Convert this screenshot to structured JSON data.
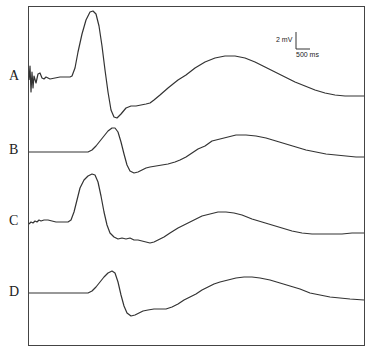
{
  "chart_data": {
    "type": "line",
    "title": "",
    "xlabel": "",
    "ylabel": "",
    "grid": false,
    "legend": "none",
    "frame": {
      "left": 28,
      "top": 6,
      "right": 364,
      "bottom": 345
    },
    "scale_bar": {
      "voltage_label": "2 mV",
      "time_label": "500 ms",
      "x": 296,
      "y_top": 32,
      "y_bottom": 49,
      "x_right": 310
    },
    "series": [
      {
        "name": "A",
        "label_pos": {
          "x": 9,
          "y": 76
        },
        "baseline_y": 78,
        "points": [
          [
            29,
            80
          ],
          [
            30,
            66
          ],
          [
            31,
            92
          ],
          [
            32,
            72
          ],
          [
            33,
            88
          ],
          [
            34,
            76
          ],
          [
            36,
            83
          ],
          [
            38,
            74
          ],
          [
            40,
            73
          ],
          [
            42,
            78
          ],
          [
            44,
            79
          ],
          [
            46,
            77
          ],
          [
            50,
            79
          ],
          [
            55,
            78
          ],
          [
            60,
            77
          ],
          [
            66,
            77
          ],
          [
            70,
            77
          ],
          [
            72,
            76
          ],
          [
            75,
            68
          ],
          [
            78,
            52
          ],
          [
            82,
            34
          ],
          [
            86,
            20
          ],
          [
            90,
            12
          ],
          [
            93,
            11
          ],
          [
            96,
            14
          ],
          [
            99,
            26
          ],
          [
            102,
            46
          ],
          [
            105,
            70
          ],
          [
            108,
            92
          ],
          [
            111,
            110
          ],
          [
            114,
            117
          ],
          [
            117,
            118
          ],
          [
            121,
            114
          ],
          [
            126,
            108
          ],
          [
            131,
            106
          ],
          [
            136,
            106
          ],
          [
            141,
            105
          ],
          [
            146,
            104
          ],
          [
            150,
            103
          ],
          [
            154,
            100
          ],
          [
            160,
            95
          ],
          [
            168,
            88
          ],
          [
            178,
            80
          ],
          [
            186,
            75
          ],
          [
            195,
            68
          ],
          [
            205,
            62
          ],
          [
            215,
            58
          ],
          [
            225,
            56
          ],
          [
            235,
            56
          ],
          [
            245,
            58
          ],
          [
            255,
            62
          ],
          [
            265,
            67
          ],
          [
            275,
            72
          ],
          [
            285,
            77
          ],
          [
            295,
            82
          ],
          [
            305,
            86
          ],
          [
            315,
            90
          ],
          [
            325,
            93
          ],
          [
            335,
            95
          ],
          [
            345,
            96
          ],
          [
            355,
            96
          ],
          [
            364,
            96
          ]
        ]
      },
      {
        "name": "B",
        "label_pos": {
          "x": 9,
          "y": 150
        },
        "baseline_y": 152,
        "points": [
          [
            29,
            152
          ],
          [
            40,
            152
          ],
          [
            50,
            152
          ],
          [
            60,
            152
          ],
          [
            70,
            152
          ],
          [
            80,
            152
          ],
          [
            88,
            152
          ],
          [
            92,
            150
          ],
          [
            96,
            146
          ],
          [
            100,
            141
          ],
          [
            104,
            136
          ],
          [
            108,
            131
          ],
          [
            112,
            128
          ],
          [
            115,
            128
          ],
          [
            118,
            132
          ],
          [
            121,
            142
          ],
          [
            124,
            154
          ],
          [
            127,
            165
          ],
          [
            130,
            171
          ],
          [
            134,
            173
          ],
          [
            138,
            172
          ],
          [
            142,
            170
          ],
          [
            146,
            168
          ],
          [
            150,
            167
          ],
          [
            156,
            166
          ],
          [
            162,
            165
          ],
          [
            168,
            164
          ],
          [
            175,
            162
          ],
          [
            180,
            160
          ],
          [
            186,
            157
          ],
          [
            192,
            153
          ],
          [
            198,
            149
          ],
          [
            205,
            146
          ],
          [
            212,
            141
          ],
          [
            220,
            139
          ],
          [
            228,
            137
          ],
          [
            236,
            135
          ],
          [
            246,
            135
          ],
          [
            256,
            136
          ],
          [
            266,
            138
          ],
          [
            276,
            141
          ],
          [
            286,
            144
          ],
          [
            296,
            147
          ],
          [
            306,
            150
          ],
          [
            316,
            152
          ],
          [
            326,
            154
          ],
          [
            336,
            155
          ],
          [
            346,
            156
          ],
          [
            356,
            157
          ],
          [
            364,
            157
          ]
        ]
      },
      {
        "name": "C",
        "label_pos": {
          "x": 9,
          "y": 221
        },
        "baseline_y": 222,
        "points": [
          [
            29,
            224
          ],
          [
            31,
            222
          ],
          [
            33,
            223
          ],
          [
            35,
            221
          ],
          [
            37,
            222
          ],
          [
            39,
            220
          ],
          [
            41,
            221
          ],
          [
            44,
            220
          ],
          [
            48,
            220
          ],
          [
            52,
            221
          ],
          [
            56,
            222
          ],
          [
            60,
            222
          ],
          [
            64,
            222
          ],
          [
            68,
            222
          ],
          [
            71,
            220
          ],
          [
            74,
            212
          ],
          [
            77,
            200
          ],
          [
            80,
            188
          ],
          [
            84,
            180
          ],
          [
            88,
            176
          ],
          [
            92,
            174
          ],
          [
            95,
            175
          ],
          [
            98,
            182
          ],
          [
            101,
            196
          ],
          [
            104,
            212
          ],
          [
            107,
            225
          ],
          [
            110,
            233
          ],
          [
            114,
            237
          ],
          [
            118,
            239
          ],
          [
            122,
            238
          ],
          [
            126,
            239
          ],
          [
            130,
            238
          ],
          [
            134,
            240
          ],
          [
            138,
            240
          ],
          [
            142,
            241
          ],
          [
            146,
            242
          ],
          [
            150,
            243
          ],
          [
            154,
            242
          ],
          [
            158,
            240
          ],
          [
            164,
            237
          ],
          [
            170,
            233
          ],
          [
            178,
            228
          ],
          [
            186,
            224
          ],
          [
            194,
            220
          ],
          [
            202,
            216
          ],
          [
            210,
            214
          ],
          [
            218,
            212
          ],
          [
            226,
            212
          ],
          [
            234,
            213
          ],
          [
            242,
            215
          ],
          [
            252,
            219
          ],
          [
            262,
            222
          ],
          [
            272,
            225
          ],
          [
            282,
            228
          ],
          [
            292,
            231
          ],
          [
            302,
            233
          ],
          [
            312,
            234
          ],
          [
            322,
            234
          ],
          [
            332,
            234
          ],
          [
            342,
            234
          ],
          [
            352,
            233
          ],
          [
            364,
            233
          ]
        ]
      },
      {
        "name": "D",
        "label_pos": {
          "x": 9,
          "y": 292
        },
        "baseline_y": 293,
        "points": [
          [
            29,
            293
          ],
          [
            40,
            293
          ],
          [
            50,
            293
          ],
          [
            60,
            293
          ],
          [
            70,
            293
          ],
          [
            80,
            293
          ],
          [
            88,
            293
          ],
          [
            92,
            291
          ],
          [
            96,
            287
          ],
          [
            100,
            282
          ],
          [
            104,
            277
          ],
          [
            108,
            273
          ],
          [
            112,
            271
          ],
          [
            115,
            273
          ],
          [
            118,
            282
          ],
          [
            121,
            295
          ],
          [
            124,
            306
          ],
          [
            127,
            313
          ],
          [
            131,
            316
          ],
          [
            135,
            315
          ],
          [
            139,
            313
          ],
          [
            143,
            311
          ],
          [
            148,
            310
          ],
          [
            154,
            309
          ],
          [
            160,
            309
          ],
          [
            166,
            309
          ],
          [
            172,
            307
          ],
          [
            178,
            304
          ],
          [
            184,
            300
          ],
          [
            190,
            297
          ],
          [
            196,
            294
          ],
          [
            202,
            290
          ],
          [
            208,
            287
          ],
          [
            214,
            284
          ],
          [
            220,
            282
          ],
          [
            228,
            280
          ],
          [
            236,
            278
          ],
          [
            244,
            277
          ],
          [
            252,
            277
          ],
          [
            260,
            278
          ],
          [
            270,
            280
          ],
          [
            280,
            283
          ],
          [
            290,
            286
          ],
          [
            300,
            289
          ],
          [
            310,
            293
          ],
          [
            320,
            295
          ],
          [
            330,
            297
          ],
          [
            340,
            298
          ],
          [
            350,
            299
          ],
          [
            364,
            300
          ]
        ]
      }
    ]
  }
}
